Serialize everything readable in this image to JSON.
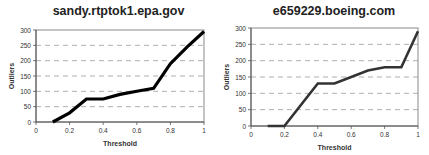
{
  "chart_data": [
    {
      "type": "line",
      "title": "sandy.rtptok1.epa.gov",
      "xlabel": "Threshold",
      "ylabel": "Outliers",
      "xlim": [
        0,
        1
      ],
      "ylim": [
        0,
        300
      ],
      "x_ticks": [
        "0",
        "0.2",
        "0.4",
        "0.6",
        "0.8",
        "1"
      ],
      "y_ticks": [
        "0",
        "50",
        "100",
        "150",
        "200",
        "250",
        "300"
      ],
      "grid": "horizontal-dashed",
      "legend": "none",
      "series": [
        {
          "name": "Outliers",
          "color": "#000000",
          "x": [
            0.1,
            0.2,
            0.3,
            0.4,
            0.5,
            0.6,
            0.7,
            0.8,
            0.9,
            1.0
          ],
          "y": [
            0,
            30,
            75,
            75,
            90,
            100,
            110,
            190,
            245,
            295
          ]
        }
      ]
    },
    {
      "type": "line",
      "title": "e659229.boeing.com",
      "xlabel": "Threshold",
      "ylabel": "Outliers",
      "xlim": [
        0,
        1
      ],
      "ylim": [
        0,
        300
      ],
      "x_ticks": [
        "0",
        "0.2",
        "0.4",
        "0.6",
        "0.8",
        "1"
      ],
      "y_ticks": [
        "0",
        "50",
        "100",
        "150",
        "200",
        "250",
        "300"
      ],
      "grid": "horizontal-dashed",
      "legend": "none",
      "series": [
        {
          "name": "Outliers",
          "color": "#333333",
          "x": [
            0.1,
            0.2,
            0.3,
            0.4,
            0.5,
            0.6,
            0.7,
            0.8,
            0.9,
            1.0
          ],
          "y": [
            0,
            0,
            65,
            130,
            130,
            150,
            170,
            180,
            180,
            290
          ]
        }
      ]
    }
  ]
}
